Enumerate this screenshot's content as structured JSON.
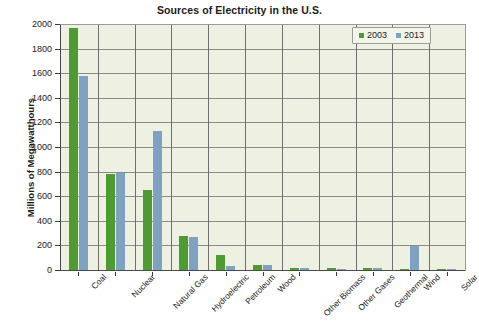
{
  "chart_data": {
    "type": "bar",
    "title": "Sources of Electricity in the U.S.",
    "xlabel": "",
    "ylabel": "Millions of Megawatthours",
    "ylim": [
      0,
      2000
    ],
    "ytick_step": 200,
    "yticks": [
      "0",
      "200",
      "400",
      "600",
      "800",
      "1000",
      "1200",
      "1400",
      "1600",
      "1800",
      "2000"
    ],
    "grid": true,
    "legend_position": "top-right",
    "categories": [
      "Coal",
      "Nuclear",
      "Natural Gas",
      "Hydroelectric",
      "Petroleum",
      "Wood",
      "Other Biomass",
      "Other Gases",
      "Geothermal",
      "Wind",
      "Solar"
    ],
    "series": [
      {
        "name": "2003",
        "color": "#4e9b31",
        "values": [
          1970,
          780,
          650,
          275,
          120,
          38,
          16,
          15,
          14,
          11,
          1
        ]
      },
      {
        "name": "2013",
        "color": "#7fa2c3",
        "values": [
          1580,
          790,
          1130,
          265,
          30,
          40,
          20,
          12,
          16,
          195,
          2
        ]
      }
    ]
  },
  "legend": {
    "items": [
      {
        "label": "2003"
      },
      {
        "label": "2013"
      }
    ]
  },
  "colors": {
    "series_2003": "#4e9b31",
    "series_2013": "#7fa2c3",
    "plot_background": "#eef0e2",
    "gridline": "#8a8a8a",
    "axis": "#3a3a3a",
    "text": "#1b1b1b",
    "page_background": "#ffffff"
  }
}
